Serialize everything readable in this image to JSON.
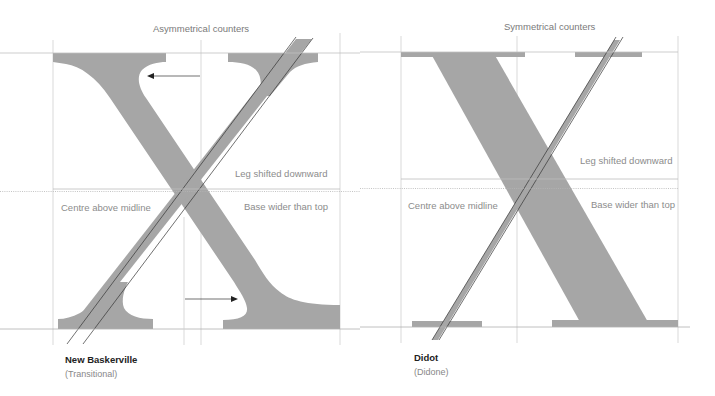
{
  "panels": [
    {
      "id": "new-baskerville",
      "title": "Asymmetrical counters",
      "labels": {
        "leg": "Leg shifted downward",
        "centre": "Centre above midline",
        "base": "Base wider than top"
      },
      "typeface": "New Baskerville",
      "classification": "(Transitional)"
    },
    {
      "id": "didot",
      "title": "Symmetrical counters",
      "labels": {
        "leg": "Leg shifted downward",
        "centre": "Centre above midline",
        "base": "Base wider than top"
      },
      "typeface": "Didot",
      "classification": "(Didone)"
    }
  ],
  "colors": {
    "glyph_fill": "#a6a6a6",
    "guide_line": "#c8c8c8",
    "hairline_stroke": "#333333",
    "label_text": "#8c8c8c",
    "name_text": "#222222"
  }
}
